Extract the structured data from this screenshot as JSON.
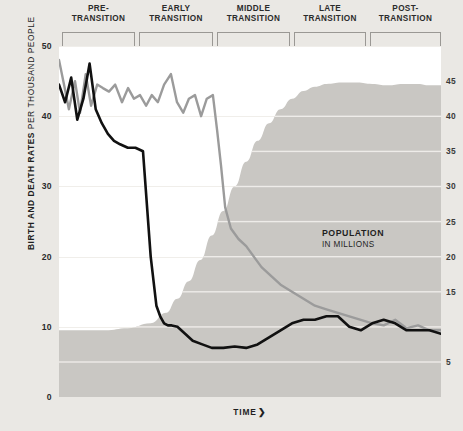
{
  "figure": {
    "background_color": "#eae8e4",
    "plot_background_color": "#ffffff",
    "top_caption": "DEMOGRAPHIC TRANSITION",
    "bottom_caption": "TIME",
    "arrow_glyph": "❯",
    "y_axis_left_title_bold": "BIRTH AND DEATH RATES",
    "y_axis_left_title_regular": "PER THOUSAND PEOPLE",
    "population_annotation_line1": "POPULATION",
    "population_annotation_line2": "IN MILLIONS"
  },
  "stages": [
    {
      "label": "PRE-\nTRANSITION",
      "x": 62,
      "width": 73
    },
    {
      "label": "EARLY\nTRANSITION",
      "x": 139,
      "width": 74
    },
    {
      "label": "MIDDLE\nTRANSITION",
      "x": 217,
      "width": 73
    },
    {
      "label": "LATE\nTRANSITION",
      "x": 294,
      "width": 72
    },
    {
      "label": "POST-\nTRANSITION",
      "x": 370,
      "width": 71
    }
  ],
  "chart_data": {
    "type": "line",
    "title": "DEMOGRAPHIC TRANSITION",
    "xlabel": "TIME",
    "ylabel": "BIRTH AND DEATH RATES PER THOUSAND PEOPLE",
    "y2label": "POPULATION IN MILLIONS",
    "grid": true,
    "legend_position": "inline-annotation",
    "xlim": [
      0,
      100
    ],
    "ylim": [
      0,
      50
    ],
    "y2lim": [
      0,
      50
    ],
    "left_ticks": [
      0,
      10,
      20,
      30,
      40,
      50
    ],
    "right_ticks": [
      5,
      10,
      15,
      20,
      25,
      30,
      35,
      40,
      45
    ],
    "right_tick_labels_visible": [
      "5",
      "15",
      "20",
      "25",
      "30",
      "35",
      "40",
      "45"
    ],
    "colors": {
      "death_rate": "#111111",
      "birth_rate": "#9b9b9b",
      "population_area": "#c9c7c3",
      "gridline": "#f0eeea",
      "bracket": "#9a9894"
    },
    "series": [
      {
        "name": "Birth rate",
        "color": "#9b9b9b",
        "unit": "per thousand people",
        "axis": "left",
        "x": [
          0,
          1.3,
          2.6,
          4.2,
          5.5,
          7.0,
          8.4,
          10.0,
          11.5,
          13.1,
          14.7,
          16.5,
          18.1,
          19.6,
          21.2,
          22.8,
          24.3,
          25.9,
          27.5,
          29.3,
          30.9,
          32.5,
          34.0,
          35.6,
          37.2,
          38.7,
          40.3,
          41.4,
          42.4,
          43.5,
          45.0,
          47.0,
          49.0,
          51.0,
          53.0,
          55.0,
          58.0,
          61.0,
          64.0,
          67.0,
          70.0,
          73.0,
          76.0,
          79.0,
          82.0,
          85.0,
          88.0,
          91.0,
          94.0,
          97.0,
          100.0
        ],
        "y": [
          48.0,
          44.5,
          41.0,
          45.0,
          40.5,
          46.0,
          41.5,
          44.5,
          44.0,
          43.5,
          44.5,
          42.0,
          44.0,
          42.5,
          43.0,
          41.5,
          43.0,
          42.0,
          44.5,
          46.0,
          42.0,
          40.5,
          42.5,
          43.0,
          40.0,
          42.5,
          43.0,
          38.0,
          33.0,
          27.0,
          24.0,
          22.5,
          21.5,
          20.0,
          18.5,
          17.5,
          16.0,
          15.0,
          14.0,
          13.0,
          12.5,
          12.0,
          11.5,
          11.0,
          10.5,
          10.2,
          11.0,
          9.8,
          10.2,
          9.5,
          9.5
        ]
      },
      {
        "name": "Death rate",
        "color": "#111111",
        "unit": "per thousand people",
        "axis": "left",
        "x": [
          0,
          1.6,
          3.2,
          4.8,
          6.4,
          8.0,
          9.6,
          11.2,
          12.8,
          14.4,
          16.0,
          18.0,
          20.0,
          22.0,
          24.0,
          25.5,
          26.5,
          27.5,
          28.5,
          29.5,
          31.0,
          33.0,
          35.0,
          37.5,
          40.0,
          43.0,
          46.0,
          49.0,
          52.0,
          55.0,
          58.0,
          61.0,
          64.0,
          67.0,
          70.0,
          73.0,
          76.0,
          79.0,
          82.0,
          85.0,
          88.0,
          91.0,
          94.0,
          97.0,
          100.0
        ],
        "y": [
          44.5,
          42.0,
          45.5,
          39.5,
          42.5,
          47.5,
          41.0,
          39.0,
          37.5,
          36.5,
          36.0,
          35.5,
          35.5,
          35.0,
          20.0,
          13.0,
          11.5,
          10.5,
          10.2,
          10.2,
          10.0,
          9.0,
          8.0,
          7.5,
          7.0,
          7.0,
          7.2,
          7.0,
          7.5,
          8.5,
          9.5,
          10.5,
          11.0,
          11.0,
          11.5,
          11.5,
          10.0,
          9.5,
          10.5,
          11.0,
          10.5,
          9.5,
          9.5,
          9.5,
          9.0
        ]
      },
      {
        "name": "Population",
        "color": "#c9c7c3",
        "unit": "millions",
        "axis": "right",
        "type": "area",
        "x": [
          0,
          6,
          12,
          18,
          24,
          28,
          31,
          34,
          37,
          40,
          43,
          46,
          49,
          52,
          55,
          58,
          61,
          64,
          67,
          70,
          74,
          78,
          82,
          86,
          90,
          94,
          97,
          100
        ],
        "y": [
          9.5,
          9.5,
          9.5,
          9.8,
          10.5,
          12.0,
          14.0,
          16.5,
          19.5,
          23.0,
          26.5,
          30.0,
          33.5,
          36.5,
          39.0,
          41.0,
          42.5,
          43.6,
          44.2,
          44.6,
          44.8,
          44.8,
          44.6,
          44.4,
          44.6,
          44.6,
          44.4,
          44.4
        ]
      }
    ]
  }
}
